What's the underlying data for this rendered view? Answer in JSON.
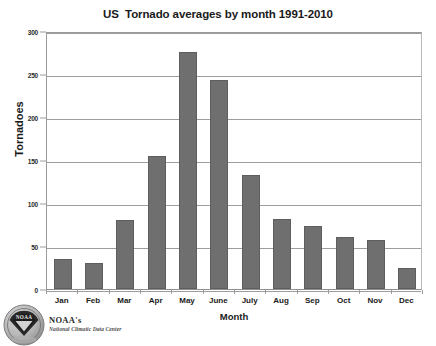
{
  "chart_data": {
    "type": "bar",
    "title": "US  Tornado averages by month 1991-2010",
    "xlabel": "Month",
    "ylabel": "Tornadoes",
    "categories": [
      "Jan",
      "Feb",
      "Mar",
      "Apr",
      "May",
      "June",
      "July",
      "Aug",
      "Sep",
      "Oct",
      "Nov",
      "Dec"
    ],
    "values": [
      35,
      30,
      80,
      155,
      276,
      243,
      133,
      81,
      73,
      61,
      57,
      24
    ],
    "ylim": [
      0,
      300
    ],
    "yticks": [
      0,
      50,
      100,
      150,
      200,
      250,
      300
    ],
    "ytick_labels": [
      "0",
      "50",
      "100",
      "150",
      "200",
      "250",
      "300"
    ],
    "grid": true,
    "legend": false,
    "bar_color": "#706f6f",
    "gridline_color": "#9d9d9d",
    "background_color": "#ffffff"
  },
  "footer": {
    "logo_name": "noaa-seal-logo",
    "logo_text": "NOAA",
    "agency": "NOAA's",
    "center": "National Climatic Data Center"
  }
}
